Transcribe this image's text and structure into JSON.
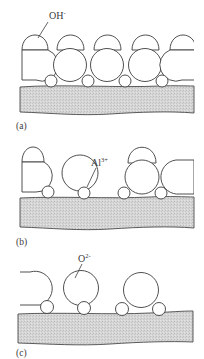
{
  "figure": {
    "colors": {
      "outline": "#3c3c3c",
      "substrate_fill": "#d9d9d9",
      "background": "#ffffff"
    },
    "panels": [
      {
        "id": "a",
        "label": "(a)",
        "annotation": {
          "text": "OH",
          "superscript": "-"
        }
      },
      {
        "id": "b",
        "label": "(b)",
        "annotation": {
          "text": "Al",
          "superscript": "3+"
        }
      },
      {
        "id": "c",
        "label": "(c)",
        "annotation": {
          "text": "O",
          "superscript": "2-"
        }
      }
    ]
  }
}
